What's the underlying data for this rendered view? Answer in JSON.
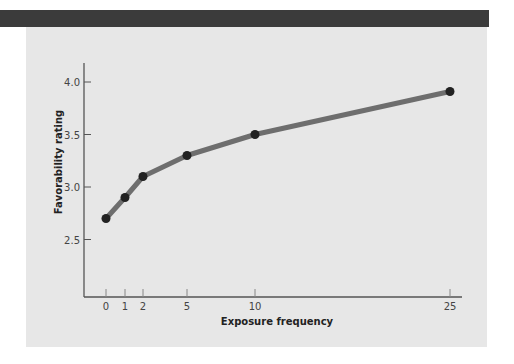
{
  "chart_data": {
    "type": "line",
    "title": "",
    "xlabel": "Exposure frequency",
    "ylabel": "Favorability rating",
    "x": [
      0,
      1,
      2,
      5,
      10,
      25
    ],
    "x_tick_labels": [
      "0",
      "1",
      "2",
      "5",
      "10",
      "25"
    ],
    "series": [
      {
        "name": "Favorability",
        "values": [
          2.7,
          2.9,
          3.1,
          3.3,
          3.5,
          3.91
        ]
      }
    ],
    "y_ticks": [
      2.5,
      3.0,
      3.5,
      4.0
    ],
    "y_tick_labels": [
      "2.5",
      "3.0",
      "3.5",
      "4.0"
    ],
    "ylim": [
      2.0,
      4.2
    ],
    "grid": false,
    "legend": "none",
    "colors": {
      "line": "#6e6e6e",
      "marker": "#222222",
      "axis": "#555555",
      "panel": "#e7e7e7",
      "header_bar": "#3b3b3b"
    }
  }
}
